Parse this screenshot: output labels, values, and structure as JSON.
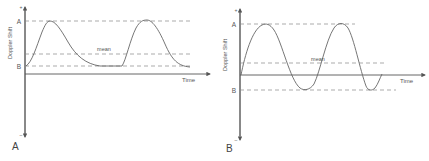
{
  "colors": {
    "axis": "#555555",
    "curve": "#666666",
    "dashed": "#888888",
    "text": "#555555"
  },
  "panels": [
    {
      "id": "A",
      "panel_label": "A",
      "y_axis_label": "Doppler Shift",
      "x_axis_label": "Time",
      "y_top_sign": "+",
      "y_bottom_sign": "–",
      "level_labels": {
        "top": "A",
        "bottom": "B"
      },
      "mean_label": "mean",
      "description": "Unidirectional flow: Doppler shift oscillates between peak A and baseline B, both above zero; flat plateau at B between pulses"
    },
    {
      "id": "B",
      "panel_label": "B",
      "y_axis_label": "Doppler Shift",
      "x_axis_label": "Time",
      "y_top_sign": "+",
      "y_bottom_sign": "–",
      "level_labels": {
        "top": "A",
        "bottom": "B"
      },
      "mean_label": "mean",
      "description": "Bidirectional flow: Doppler shift oscillates sinusoidally between A (positive) and B (negative, below the time axis)"
    }
  ]
}
